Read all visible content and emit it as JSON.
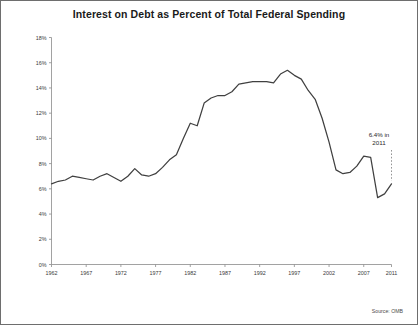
{
  "chart_data": {
    "type": "line",
    "title": "Interest on Debt as Percent of Total Federal Spending",
    "xlabel": "",
    "ylabel": "",
    "xlim": [
      1962,
      2011
    ],
    "ylim": [
      0,
      18
    ],
    "ytick_labels": [
      "0%",
      "2%",
      "4%",
      "6%",
      "8%",
      "10%",
      "12%",
      "14%",
      "16%",
      "18%"
    ],
    "ytick_values": [
      0,
      2,
      4,
      6,
      8,
      10,
      12,
      14,
      16,
      18
    ],
    "xtick_labels": [
      "1962",
      "1967",
      "1972",
      "1977",
      "1982",
      "1987",
      "1992",
      "1997",
      "2002",
      "2007",
      "2011"
    ],
    "xtick_values": [
      1962,
      1967,
      1972,
      1977,
      1982,
      1987,
      1992,
      1997,
      2002,
      2007,
      2011
    ],
    "grid": false,
    "legend": "none",
    "line_color": "#404040",
    "axis_color": "#8a8a8a",
    "annotations": [
      {
        "text_line1": "6.4% in",
        "text_line2": "2011",
        "x": 2011,
        "y": 6.4
      }
    ],
    "source": "Source: OMB",
    "series": [
      {
        "name": "Interest on Debt as Percent of Total Federal Spending",
        "x": [
          1962,
          1963,
          1964,
          1965,
          1966,
          1967,
          1968,
          1969,
          1970,
          1971,
          1972,
          1973,
          1974,
          1975,
          1976,
          1977,
          1978,
          1979,
          1980,
          1981,
          1982,
          1983,
          1984,
          1985,
          1986,
          1987,
          1988,
          1989,
          1990,
          1991,
          1992,
          1993,
          1994,
          1995,
          1996,
          1997,
          1998,
          1999,
          2000,
          2001,
          2002,
          2003,
          2004,
          2005,
          2006,
          2007,
          2008,
          2009,
          2010,
          2011
        ],
        "y": [
          6.4,
          6.6,
          6.7,
          7.0,
          6.9,
          6.8,
          6.7,
          7.0,
          7.2,
          6.9,
          6.6,
          7.0,
          7.6,
          7.1,
          7.0,
          7.2,
          7.7,
          8.3,
          8.7,
          10.0,
          11.2,
          11.0,
          12.8,
          13.2,
          13.4,
          13.4,
          13.7,
          14.3,
          14.4,
          14.5,
          14.5,
          14.5,
          14.4,
          15.1,
          15.4,
          15.0,
          14.7,
          13.8,
          13.1,
          11.6,
          9.7,
          7.5,
          7.2,
          7.3,
          7.8,
          8.6,
          8.5,
          5.3,
          5.6,
          6.4
        ]
      }
    ]
  }
}
